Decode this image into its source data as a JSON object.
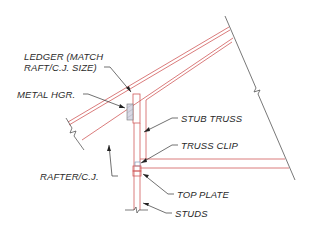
{
  "diagram": {
    "colors": {
      "member_line": "#d05a5a",
      "boundary_line": "#555555",
      "leader_line": "#333333",
      "hanger_fill": "#d8d8e4",
      "text": "#2a2a2a"
    },
    "labels": {
      "ledger_line1": "LEDGER (MATCH",
      "ledger_line2": "RAFT/C.J. SIZE)",
      "metal_hanger": "METAL HGR.",
      "rafter_cj": "RAFTER/C.J.",
      "stub_truss": "STUB TRUSS",
      "truss_clip": "TRUSS CLIP",
      "top_plate": "TOP PLATE",
      "studs": "STUDS"
    },
    "components": [
      "ledger",
      "metal-hanger",
      "rafter-ceiling-joist",
      "stub-truss",
      "truss-clip",
      "top-plate",
      "studs",
      "roof-boundary-break-line"
    ]
  }
}
